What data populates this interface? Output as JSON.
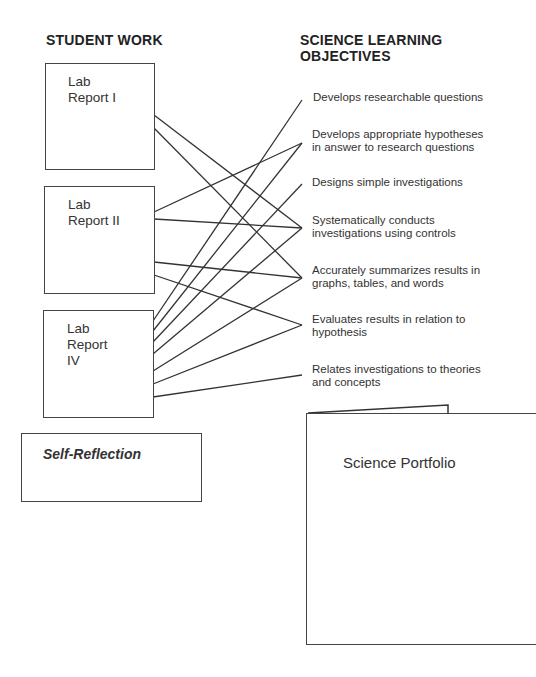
{
  "headings": {
    "student_work": "STUDENT WORK",
    "objectives": "SCIENCE LEARNING OBJECTIVES"
  },
  "student_work": [
    {
      "id": "lab1",
      "lines": [
        "Lab",
        "Report I"
      ]
    },
    {
      "id": "lab2",
      "lines": [
        "Lab",
        "Report II"
      ]
    },
    {
      "id": "lab4",
      "lines": [
        "Lab",
        "Report",
        "IV"
      ]
    }
  ],
  "self_reflection": "Self-Reflection",
  "objectives": [
    {
      "lines": [
        "Develops researchable questions"
      ]
    },
    {
      "lines": [
        "Develops appropriate hypotheses",
        "in answer to research questions"
      ]
    },
    {
      "lines": [
        "Designs simple investigations"
      ]
    },
    {
      "lines": [
        "Systematically conducts",
        "investigations using controls"
      ]
    },
    {
      "lines": [
        "Accurately summarizes results in",
        "graphs, tables, and words"
      ]
    },
    {
      "lines": [
        "Evaluates results in relation to",
        "hypothesis"
      ]
    },
    {
      "lines": [
        "Relates investigations to theories",
        "and concepts"
      ]
    }
  ],
  "portfolio": "Science Portfolio",
  "connections": [
    {
      "from": "Lab Report I",
      "to": "Systematically conducts investigations using controls"
    },
    {
      "from": "Lab Report I",
      "to": "Accurately summarizes results in graphs, tables, and words"
    },
    {
      "from": "Lab Report II",
      "to": "Develops appropriate hypotheses in answer to research questions"
    },
    {
      "from": "Lab Report II",
      "to": "Systematically conducts investigations using controls"
    },
    {
      "from": "Lab Report II",
      "to": "Accurately summarizes results in graphs, tables, and words"
    },
    {
      "from": "Lab Report II",
      "to": "Evaluates results in relation to hypothesis"
    },
    {
      "from": "Lab Report IV",
      "to": "Develops researchable questions"
    },
    {
      "from": "Lab Report IV",
      "to": "Develops appropriate hypotheses in answer to research questions"
    },
    {
      "from": "Lab Report IV",
      "to": "Designs simple investigations"
    },
    {
      "from": "Lab Report IV",
      "to": "Systematically conducts investigations using controls"
    },
    {
      "from": "Lab Report IV",
      "to": "Accurately summarizes results in graphs, tables, and words"
    },
    {
      "from": "Lab Report IV",
      "to": "Evaluates results in relation to hypothesis"
    },
    {
      "from": "Lab Report IV",
      "to": "Relates investigations to theories and concepts"
    }
  ],
  "colors": {
    "line": "#333333",
    "border": "#444444",
    "text": "#333333"
  }
}
